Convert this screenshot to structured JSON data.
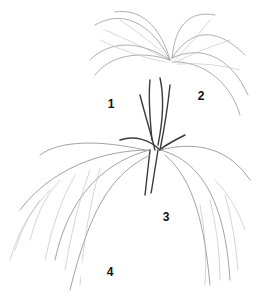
{
  "illustration": {
    "subject": "palm plant line drawing",
    "colors": {
      "background": "#ffffff",
      "frond_dark": "#555555",
      "frond_mid": "#8a8a8a",
      "frond_light": "#c4c4c4",
      "crown_dark": "#2e2e2e",
      "label_text": "#111111"
    }
  },
  "labels": [
    {
      "text": "1",
      "x": 111,
      "y": 104,
      "r": 27
    },
    {
      "text": "2",
      "x": 201,
      "y": 96,
      "r": 22
    },
    {
      "text": "3",
      "x": 166,
      "y": 217,
      "r": 28
    },
    {
      "text": "4",
      "x": 110,
      "y": 272,
      "r": 27
    }
  ]
}
